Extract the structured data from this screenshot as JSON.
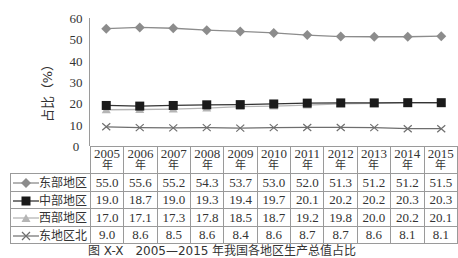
{
  "chart_data": {
    "type": "line",
    "title": "",
    "xlabel": "",
    "ylabel": "占比（%）",
    "ylim": [
      0,
      60
    ],
    "yticks": [
      0,
      10,
      20,
      30,
      40,
      50,
      60
    ],
    "grid": false,
    "legend_position": "table-left",
    "categories": [
      "2005年",
      "2006年",
      "2007年",
      "2008年",
      "2009年",
      "2010年",
      "2011年",
      "2012年",
      "2013年",
      "2014年",
      "2015年"
    ],
    "series": [
      {
        "name": "东部地区",
        "marker": "diamond",
        "color": "#8c8c8c",
        "values": [
          55.0,
          55.6,
          55.2,
          54.3,
          53.7,
          53.0,
          52.0,
          51.3,
          51.2,
          51.2,
          51.5
        ]
      },
      {
        "name": "中部地区",
        "marker": "square",
        "color": "#1a1a1a",
        "values": [
          19.0,
          18.7,
          19.0,
          19.3,
          19.4,
          19.7,
          20.1,
          20.2,
          20.2,
          20.3,
          20.3
        ]
      },
      {
        "name": "西部地区",
        "marker": "triangle",
        "color": "#b5b5b5",
        "values": [
          17.0,
          17.1,
          17.3,
          17.8,
          18.5,
          18.7,
          19.2,
          19.8,
          20.0,
          20.2,
          20.1
        ]
      },
      {
        "name": "东地区北",
        "marker": "x",
        "color": "#6e6e6e",
        "values": [
          9.0,
          8.6,
          8.5,
          8.6,
          8.4,
          8.6,
          8.7,
          8.7,
          8.6,
          8.1,
          8.1
        ]
      }
    ]
  },
  "table": {
    "header_years": [
      "2005",
      "2006",
      "2007",
      "2008",
      "2009",
      "2010",
      "2011",
      "2012",
      "2013",
      "2014",
      "2015"
    ],
    "year_suffix": "年",
    "rows": [
      {
        "label": "东部地区",
        "values": [
          "55.0",
          "55.6",
          "55.2",
          "54.3",
          "53.7",
          "53.0",
          "52.0",
          "51.3",
          "51.2",
          "51.2",
          "51.5"
        ]
      },
      {
        "label": "中部地区",
        "values": [
          "19.0",
          "18.7",
          "19.0",
          "19.3",
          "19.4",
          "19.7",
          "20.1",
          "20.2",
          "20.2",
          "20.3",
          "20.3"
        ]
      },
      {
        "label": "西部地区",
        "values": [
          "17.0",
          "17.1",
          "17.3",
          "17.8",
          "18.5",
          "18.7",
          "19.2",
          "19.8",
          "20.0",
          "20.2",
          "20.1"
        ]
      },
      {
        "label": "东地区北",
        "values": [
          "9.0",
          "8.6",
          "8.5",
          "8.6",
          "8.4",
          "8.6",
          "8.7",
          "8.7",
          "8.6",
          "8.1",
          "8.1"
        ]
      }
    ]
  },
  "caption": "图 X-X　2005—2015 年我国各地区生产总值占比"
}
